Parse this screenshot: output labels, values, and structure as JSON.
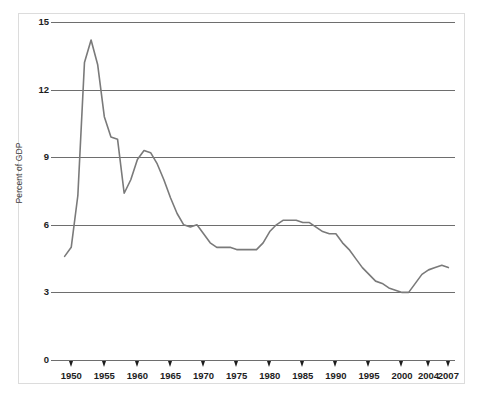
{
  "chart_data": {
    "type": "line",
    "title": "",
    "xlabel": "",
    "ylabel": "Percent of GDP",
    "xlim": [
      1948,
      2008
    ],
    "ylim": [
      0,
      15
    ],
    "grid": true,
    "legend": "none",
    "line_color": "#7a7a7a",
    "grid_color": "#6e6e6e",
    "axis_color": "#6e6e6e",
    "y_ticks": [
      0,
      3,
      6,
      9,
      12,
      15
    ],
    "x_ticks": [
      1950,
      1955,
      1960,
      1965,
      1970,
      1975,
      1980,
      1985,
      1990,
      1995,
      2000,
      2004,
      2007
    ],
    "x_tick_labels": [
      "1950",
      "1955",
      "1960",
      "1965",
      "1970",
      "1975",
      "1980",
      "1985",
      "1990",
      "1995",
      "2000",
      "2004",
      "2007"
    ],
    "y_tick_labels": [
      "0",
      "3",
      "6",
      "9",
      "12",
      "15"
    ],
    "series": [
      {
        "name": "Defense spending",
        "x": [
          1949,
          1950,
          1951,
          1952,
          1953,
          1954,
          1955,
          1956,
          1957,
          1958,
          1959,
          1960,
          1961,
          1962,
          1963,
          1964,
          1965,
          1966,
          1967,
          1968,
          1969,
          1970,
          1971,
          1972,
          1973,
          1974,
          1975,
          1976,
          1977,
          1978,
          1979,
          1980,
          1981,
          1982,
          1983,
          1984,
          1985,
          1986,
          1987,
          1988,
          1989,
          1990,
          1991,
          1992,
          1993,
          1994,
          1995,
          1996,
          1997,
          1998,
          1999,
          2000,
          2001,
          2002,
          2003,
          2004,
          2005,
          2006,
          2007
        ],
        "values": [
          4.6,
          5.0,
          7.3,
          13.2,
          14.2,
          13.1,
          10.8,
          9.9,
          9.8,
          7.4,
          8.0,
          8.9,
          9.3,
          9.2,
          8.7,
          8.0,
          7.2,
          6.5,
          6.0,
          5.9,
          6.0,
          5.6,
          5.2,
          5.0,
          5.0,
          5.0,
          4.9,
          4.9,
          4.9,
          4.9,
          5.2,
          5.7,
          6.0,
          6.2,
          6.2,
          6.2,
          6.1,
          6.1,
          5.9,
          5.7,
          5.6,
          5.6,
          5.2,
          4.9,
          4.5,
          4.1,
          3.8,
          3.5,
          3.4,
          3.2,
          3.1,
          3.0,
          3.0,
          3.4,
          3.8,
          4.0,
          4.1,
          4.2,
          4.1
        ]
      }
    ]
  }
}
